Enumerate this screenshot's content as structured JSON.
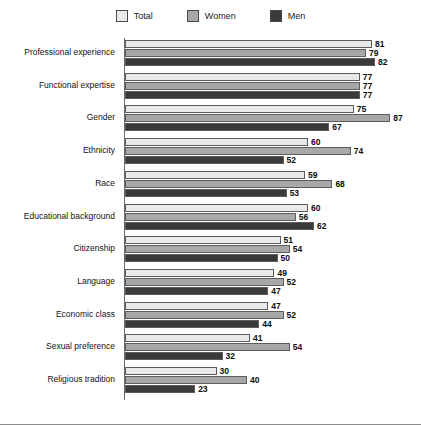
{
  "legend": {
    "items": [
      {
        "label": "Total",
        "color": "#e9e9e9",
        "key": "total"
      },
      {
        "label": "Women",
        "color": "#a8a8a8",
        "key": "women"
      },
      {
        "label": "Men",
        "color": "#3a3a3a",
        "key": "men"
      }
    ]
  },
  "chart_data": {
    "type": "bar",
    "orientation": "horizontal",
    "title": "",
    "xlabel": "",
    "ylabel": "",
    "xlim": [
      0,
      95
    ],
    "grid": false,
    "legend_position": "top-center",
    "value_labels": true,
    "categories": [
      "Professional experience",
      "Functional expertise",
      "Gender",
      "Ethnicity",
      "Race",
      "Educational background",
      "Citizenship",
      "Language",
      "Economic class",
      "Sexual preference",
      "Religious tradition"
    ],
    "series": [
      {
        "name": "Total",
        "color": "#e9e9e9",
        "values": [
          81,
          77,
          75,
          60,
          59,
          60,
          51,
          49,
          47,
          41,
          30
        ]
      },
      {
        "name": "Women",
        "color": "#a8a8a8",
        "values": [
          79,
          77,
          87,
          74,
          68,
          56,
          54,
          52,
          52,
          54,
          40
        ]
      },
      {
        "name": "Men",
        "color": "#3a3a3a",
        "values": [
          82,
          77,
          67,
          52,
          53,
          62,
          50,
          47,
          44,
          32,
          23
        ]
      }
    ]
  }
}
